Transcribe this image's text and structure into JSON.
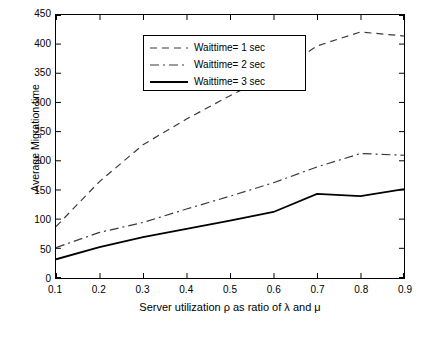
{
  "chart_data": {
    "type": "line",
    "title": "",
    "xlabel": "Server utilization ρ as ratio of λ and μ",
    "ylabel": "Average Migration time",
    "xlim": [
      0.1,
      0.9
    ],
    "ylim": [
      0,
      450
    ],
    "xticks": [
      "0.1",
      "0.2",
      "0.3",
      "0.4",
      "0.5",
      "0.6",
      "0.7",
      "0.8",
      "0.9"
    ],
    "yticks": [
      "0",
      "50",
      "100",
      "150",
      "200",
      "250",
      "300",
      "350",
      "400",
      "450"
    ],
    "grid": false,
    "legend_position": "top-left",
    "x": [
      0.1,
      0.2,
      0.3,
      0.4,
      0.5,
      0.6,
      0.7,
      0.8,
      0.9
    ],
    "series": [
      {
        "name": "Waittime= 1 sec",
        "style": "dashed",
        "color": "#3a3a3a",
        "values": [
          88,
          165,
          228,
          272,
          312,
          348,
          397,
          421,
          414
        ]
      },
      {
        "name": "Waittime= 2 sec",
        "style": "dash-dot",
        "color": "#3a3a3a",
        "values": [
          52,
          78,
          95,
          118,
          140,
          163,
          190,
          213,
          210
        ]
      },
      {
        "name": "Waittime= 3 sec",
        "style": "solid",
        "color": "#000000",
        "values": [
          32,
          53,
          70,
          84,
          98,
          113,
          144,
          140,
          152
        ]
      }
    ]
  },
  "legend": {
    "items": [
      {
        "label": "Waittime= 1 sec"
      },
      {
        "label": "Waittime= 2 sec"
      },
      {
        "label": "Waittime= 3 sec"
      }
    ]
  }
}
